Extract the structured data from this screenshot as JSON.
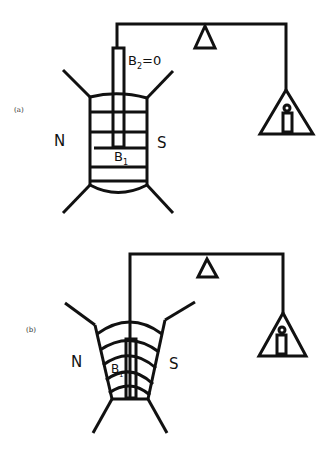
{
  "figure": {
    "panels": [
      {
        "id": "a",
        "label": "(a)",
        "pole_left": "N",
        "pole_right": "S",
        "field_inside": "B",
        "field_inside_sub": "1",
        "field_outside": "B",
        "field_outside_sub": "2",
        "field_outside_value": "=0",
        "field_type": "uniform"
      },
      {
        "id": "b",
        "label": "(b)",
        "pole_left": "N",
        "pole_right": "S",
        "field_inside": "B",
        "field_inside_sub": "1",
        "field_type": "non-uniform"
      }
    ],
    "colors": {
      "ink": "#111111",
      "background": "#ffffff"
    }
  }
}
